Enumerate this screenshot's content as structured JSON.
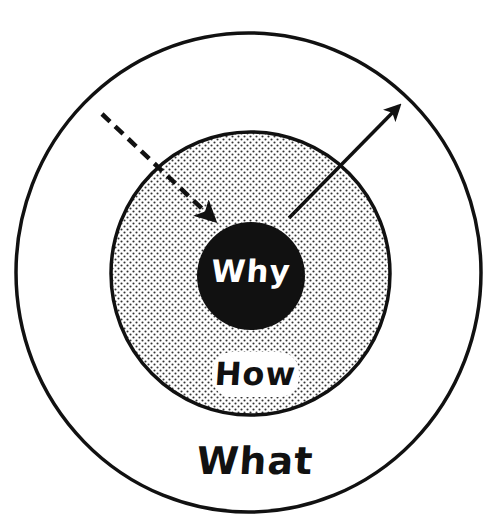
{
  "diagram": {
    "type": "golden-circle",
    "rings": [
      {
        "id": "why",
        "label": "Why",
        "position": "center",
        "fill": "#111111",
        "text_color": "#ffffff"
      },
      {
        "id": "how",
        "label": "How",
        "position": "middle",
        "fill": "dotted-gray",
        "text_color": "#111111"
      },
      {
        "id": "what",
        "label": "What",
        "position": "outer",
        "fill": "#ffffff",
        "text_color": "#111111"
      }
    ],
    "arrows": [
      {
        "style": "dashed",
        "direction": "inward",
        "from": "outside-upper-left",
        "to": "why"
      },
      {
        "style": "solid",
        "direction": "outward",
        "from": "why",
        "to": "what-edge-upper-right"
      }
    ],
    "colors": {
      "stroke": "#111111",
      "background": "#ffffff",
      "dot": "#333333"
    }
  }
}
